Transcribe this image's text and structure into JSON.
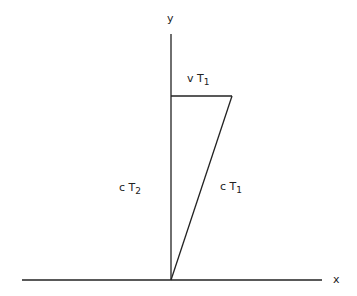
{
  "diagram": {
    "axes": {
      "x_label": "x",
      "y_label": "y"
    },
    "labels": {
      "top": {
        "var": "v T",
        "sub": "1"
      },
      "left": {
        "var": "c T",
        "sub": "2"
      },
      "hyp": {
        "var": "c T",
        "sub": "1"
      }
    },
    "colors": {
      "line": "#222222",
      "background": "#ffffff"
    }
  }
}
